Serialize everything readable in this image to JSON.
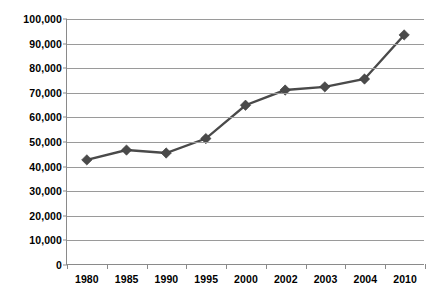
{
  "chart_data": {
    "type": "line",
    "title": "",
    "subtitle": "",
    "xlabel": "",
    "ylabel": "",
    "categories": [
      "1980",
      "1985",
      "1990",
      "1995",
      "2000",
      "2002",
      "2003",
      "2004",
      "2010"
    ],
    "values": [
      42500,
      46500,
      45300,
      51200,
      64800,
      71000,
      72300,
      75500,
      93500
    ],
    "series": [
      {
        "name": "",
        "values": [
          42500,
          46500,
          45300,
          51200,
          64800,
          71000,
          72300,
          75500,
          93500
        ]
      }
    ],
    "ylim": [
      0,
      100000
    ],
    "y_ticks": [
      0,
      10000,
      20000,
      30000,
      40000,
      50000,
      60000,
      70000,
      80000,
      90000,
      100000
    ],
    "y_tick_labels": [
      "0",
      "10,000",
      "20,000",
      "30,000",
      "40,000",
      "50,000",
      "60,000",
      "70,000",
      "80,000",
      "90,000",
      "100,000"
    ],
    "x_tick_labels": [
      "1980",
      "1985",
      "1990",
      "1995",
      "2000",
      "2002",
      "2003",
      "2004",
      "2010"
    ],
    "grid": true,
    "grid_axis": "y",
    "legend": false,
    "legend_position": "none",
    "marker": "diamond",
    "colors": {
      "series_line": "#4a4a4a",
      "series_marker": "#4a4a4a",
      "gridline": "#9a9a9a",
      "axis": "#8a8a8a",
      "text": "#000000",
      "background": "#ffffff"
    }
  }
}
